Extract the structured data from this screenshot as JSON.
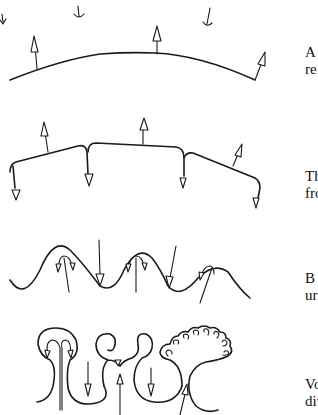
{
  "diagram": {
    "stages": [
      {
        "id": "stage-1",
        "description": "smooth curved surface with outward arrows and incoming small arrows",
        "caption_lines": [
          "A",
          "re"
        ]
      },
      {
        "id": "stage-2",
        "description": "segmented surface with cusps; arrows out of segments and down at cusps",
        "caption_lines": [
          "Th",
          "fro"
        ]
      },
      {
        "id": "stage-3",
        "description": "wavy surface with bubbles; arrows rising inside bumps and falling in troughs",
        "caption_lines": [
          "B",
          "ur"
        ]
      },
      {
        "id": "stage-4",
        "description": "mushroom-shaped vortex structures with further branching",
        "caption_lines": [
          "Vo",
          "div"
        ]
      }
    ],
    "colors": {
      "ink": "#1a1a1a",
      "background": "#ffffff"
    }
  }
}
